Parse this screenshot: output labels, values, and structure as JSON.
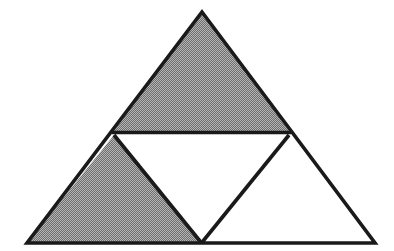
{
  "figure": {
    "title": "Subdivided triangle figure",
    "canvas": {
      "width": 394,
      "height": 251,
      "background_color": "#ffffff"
    },
    "style": {
      "stroke_color": "#1a1a1a",
      "stroke_width": 3.6,
      "shaded_fill_color": "#868686",
      "unshaded_fill_color": "#ffffff",
      "dither_light_color": "#b9b9b9",
      "dither_dark_color": "#545454"
    },
    "vertices": {
      "apex": {
        "label": "A",
        "x": 202,
        "y": 12
      },
      "bottom_left": {
        "label": "B",
        "x": 27,
        "y": 243
      },
      "bottom_right": {
        "label": "C",
        "x": 375,
        "y": 243
      },
      "mid_left": {
        "label": "M_AB",
        "x": 114,
        "y": 131
      },
      "mid_right": {
        "label": "M_AC",
        "x": 289,
        "y": 131
      },
      "mid_bottom": {
        "label": "M_BC",
        "x": 201,
        "y": 243
      }
    },
    "regions": [
      {
        "name": "top-triangle",
        "position": "top",
        "shaded": true,
        "fill": "#868686",
        "points": "202,12 114,131 289,131"
      },
      {
        "name": "lower-left-triangle",
        "position": "lower-left",
        "shaded": true,
        "fill": "#868686",
        "points": "114,135 201,243 27,243"
      },
      {
        "name": "lower-right-triangle",
        "position": "lower-right",
        "shaded": false,
        "fill": "#ffffff",
        "points": "289,135 375,243 201,243"
      },
      {
        "name": "central-inverted-triangle",
        "position": "center",
        "shaded": false,
        "fill": "#ffffff",
        "points": "114,135 289,135 201,243"
      }
    ],
    "edges": [
      {
        "name": "left-outer-edge",
        "x1": 202,
        "y1": 12,
        "x2": 27,
        "y2": 243
      },
      {
        "name": "right-outer-edge",
        "x1": 202,
        "y1": 12,
        "x2": 375,
        "y2": 243
      },
      {
        "name": "bottom-outer-edge",
        "x1": 27,
        "y1": 243,
        "x2": 375,
        "y2": 243
      },
      {
        "name": "midline-horizontal",
        "x1": 114,
        "y1": 133,
        "x2": 289,
        "y2": 133
      },
      {
        "name": "midline-left-descending",
        "x1": 114,
        "y1": 135,
        "x2": 201,
        "y2": 243
      },
      {
        "name": "midline-right-descending",
        "x1": 289,
        "y1": 135,
        "x2": 201,
        "y2": 243
      }
    ],
    "counts": {
      "total_small_triangles": 4,
      "shaded_triangles": 2,
      "unshaded_triangles": 2,
      "shaded_fraction": "1/2"
    }
  }
}
